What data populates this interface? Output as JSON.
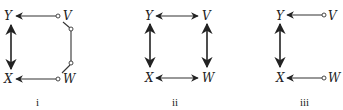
{
  "panels": [
    {
      "id": "i",
      "caption": "i",
      "nodes": {
        "Y": "Y",
        "V": "V",
        "X": "X",
        "W": "W"
      },
      "edges": [
        {
          "from": "V",
          "to": "Y",
          "type": "circle-arrow"
        },
        {
          "from": "X",
          "to": "Y",
          "type": "bidirected"
        },
        {
          "from": "W",
          "to": "X",
          "type": "circle-arrow"
        },
        {
          "from": "V",
          "to": "W",
          "type": "circle-circle-path"
        }
      ]
    },
    {
      "id": "ii",
      "caption": "ii",
      "nodes": {
        "Y": "Y",
        "V": "V",
        "X": "X",
        "W": "W"
      },
      "edges": [
        {
          "from": "Y",
          "to": "V",
          "type": "bidirected"
        },
        {
          "from": "Y",
          "to": "X",
          "type": "bidirected"
        },
        {
          "from": "V",
          "to": "W",
          "type": "bidirected"
        },
        {
          "from": "X",
          "to": "W",
          "type": "bidirected"
        }
      ]
    },
    {
      "id": "iii",
      "caption": "iii",
      "nodes": {
        "Y": "Y",
        "V": "V",
        "X": "X",
        "W": "W"
      },
      "edges": [
        {
          "from": "V",
          "to": "Y",
          "type": "circle-arrow"
        },
        {
          "from": "Y",
          "to": "X",
          "type": "bidirected"
        },
        {
          "from": "W",
          "to": "X",
          "type": "circle-arrow"
        }
      ]
    }
  ]
}
